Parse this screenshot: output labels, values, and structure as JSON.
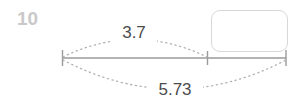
{
  "question": {
    "number": "10"
  },
  "answer_box": {
    "value": "",
    "placeholder": ""
  },
  "diagram": {
    "type": "number-line-with-measure-arcs",
    "baseline": {
      "start_x": 62,
      "end_x": 286,
      "y": 58,
      "color": "#9a9a9a"
    },
    "ticks": [
      {
        "name": "left-endpoint",
        "x": 62
      },
      {
        "name": "middle-divider",
        "x": 207
      },
      {
        "name": "right-endpoint",
        "x": 286
      }
    ],
    "measures": [
      {
        "name": "upper-measure",
        "label": "3.7",
        "from_tick": "left-endpoint",
        "to_tick": "middle-divider",
        "side": "above",
        "label_x": 134,
        "label_y": 33,
        "arc_peak_y": 36,
        "style": "dotted",
        "color": "#b0b0b0"
      },
      {
        "name": "lower-measure",
        "label": "5.73",
        "from_tick": "left-endpoint",
        "to_tick": "right-endpoint",
        "side": "below",
        "label_x": 175,
        "label_y": 90,
        "arc_peak_y": 90,
        "style": "dotted",
        "color": "#b0b0b0"
      }
    ]
  },
  "colors": {
    "question_number": "#c9c9c9",
    "line": "#9a9a9a",
    "dotted_arc": "#b0b0b0",
    "label_text": "#4c4c4c",
    "box_border": "#d8d8d8",
    "background": "#ffffff"
  }
}
